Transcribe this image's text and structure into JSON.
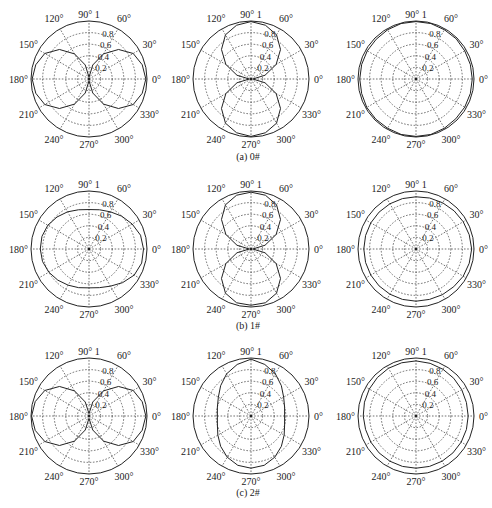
{
  "figure": {
    "captions": [
      "(a) 0#",
      "(b) 1#",
      "(c) 2#"
    ]
  },
  "axes": {
    "angle_ticks": [
      0,
      30,
      60,
      90,
      120,
      150,
      180,
      210,
      240,
      270,
      300,
      330
    ],
    "angle_labels": [
      "0°",
      "30°",
      "60°",
      "90°",
      "120°",
      "150°",
      "180°",
      "210°",
      "240°",
      "270°",
      "300°",
      "330°"
    ],
    "radial_ticks": [
      0.2,
      0.4,
      0.6,
      0.8,
      1
    ],
    "radial_labels": [
      "0.2",
      "0.4",
      "0.6",
      "0.8",
      "1"
    ],
    "rmax": 1,
    "grid": "dashed"
  },
  "chart_data": [
    {
      "type": "polar",
      "title": "(a) 0# — X direction",
      "row": 0,
      "col": 0,
      "theta_step_deg": 15,
      "r": [
        0.98,
        0.95,
        0.88,
        0.72,
        0.5,
        0.25,
        0.03,
        0.25,
        0.5,
        0.72,
        0.88,
        0.95,
        0.98,
        0.95,
        0.88,
        0.72,
        0.5,
        0.25,
        0.03,
        0.25,
        0.5,
        0.72,
        0.88,
        0.95
      ]
    },
    {
      "type": "polar",
      "title": "(a) 0# — Y direction",
      "row": 0,
      "col": 1,
      "theta_step_deg": 15,
      "r": [
        0.03,
        0.25,
        0.5,
        0.72,
        0.88,
        0.96,
        0.99,
        0.96,
        0.88,
        0.72,
        0.5,
        0.25,
        0.03,
        0.25,
        0.5,
        0.72,
        0.88,
        0.96,
        0.99,
        0.96,
        0.88,
        0.72,
        0.5,
        0.25
      ]
    },
    {
      "type": "polar",
      "title": "(a) 0# — Z direction",
      "row": 0,
      "col": 2,
      "theta_step_deg": 15,
      "r": [
        0.97,
        0.97,
        0.97,
        0.98,
        0.98,
        0.99,
        0.99,
        0.99,
        0.98,
        0.97,
        0.97,
        0.97,
        0.97,
        0.97,
        0.98,
        0.98,
        0.98,
        0.99,
        0.99,
        0.99,
        0.98,
        0.97,
        0.97,
        0.97
      ]
    },
    {
      "type": "polar",
      "title": "(b) 1# — X direction",
      "row": 1,
      "col": 0,
      "theta_step_deg": 15,
      "r": [
        0.94,
        0.92,
        0.86,
        0.8,
        0.74,
        0.7,
        0.68,
        0.7,
        0.74,
        0.78,
        0.82,
        0.84,
        0.84,
        0.83,
        0.8,
        0.76,
        0.72,
        0.69,
        0.67,
        0.69,
        0.74,
        0.82,
        0.9,
        0.94
      ]
    },
    {
      "type": "polar",
      "title": "(b) 1# — Y direction",
      "row": 1,
      "col": 1,
      "theta_step_deg": 15,
      "r": [
        0.03,
        0.25,
        0.5,
        0.72,
        0.88,
        0.96,
        0.98,
        0.96,
        0.88,
        0.72,
        0.5,
        0.25,
        0.03,
        0.25,
        0.5,
        0.72,
        0.88,
        0.96,
        0.97,
        0.96,
        0.88,
        0.72,
        0.5,
        0.25
      ]
    },
    {
      "type": "polar",
      "title": "(b) 1# — Z direction",
      "row": 1,
      "col": 2,
      "theta_step_deg": 15,
      "r": [
        0.96,
        0.95,
        0.94,
        0.93,
        0.92,
        0.91,
        0.9,
        0.9,
        0.9,
        0.9,
        0.9,
        0.9,
        0.9,
        0.9,
        0.9,
        0.9,
        0.9,
        0.9,
        0.9,
        0.9,
        0.91,
        0.92,
        0.94,
        0.95
      ]
    },
    {
      "type": "polar",
      "title": "(c) 2# — X direction",
      "row": 2,
      "col": 0,
      "theta_step_deg": 15,
      "r": [
        0.98,
        0.95,
        0.88,
        0.72,
        0.5,
        0.25,
        0.04,
        0.25,
        0.5,
        0.72,
        0.88,
        0.96,
        0.99,
        0.96,
        0.88,
        0.72,
        0.5,
        0.25,
        0.04,
        0.25,
        0.5,
        0.72,
        0.88,
        0.95
      ]
    },
    {
      "type": "polar",
      "title": "(c) 2# — Y direction",
      "row": 2,
      "col": 1,
      "theta_step_deg": 15,
      "r": [
        0.58,
        0.6,
        0.65,
        0.74,
        0.84,
        0.92,
        0.98,
        0.92,
        0.84,
        0.74,
        0.65,
        0.6,
        0.58,
        0.6,
        0.66,
        0.74,
        0.82,
        0.88,
        0.9,
        0.88,
        0.82,
        0.74,
        0.66,
        0.6
      ]
    },
    {
      "type": "polar",
      "title": "(c) 2# — Z direction",
      "row": 2,
      "col": 2,
      "theta_step_deg": 15,
      "r": [
        0.9,
        0.9,
        0.91,
        0.92,
        0.93,
        0.94,
        0.95,
        0.95,
        0.95,
        0.94,
        0.93,
        0.92,
        0.91,
        0.9,
        0.9,
        0.9,
        0.9,
        0.9,
        0.9,
        0.9,
        0.9,
        0.9,
        0.9,
        0.9
      ]
    }
  ]
}
